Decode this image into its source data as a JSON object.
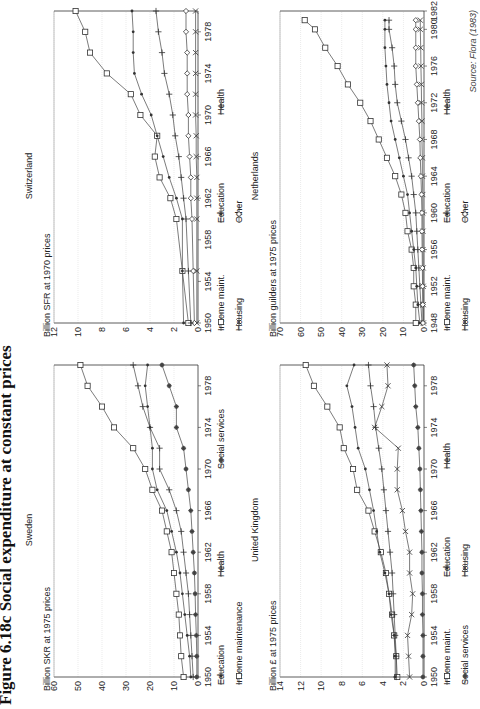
{
  "figure": {
    "title": "Figure 6.18c  Social expenditure at constant prices",
    "source": "Source: Flora (1983)"
  },
  "chart_data": [
    {
      "id": "sweden",
      "type": "line",
      "title": "Sweden",
      "ylabel": "Billion SKR at 1975 prices",
      "xlabel": "",
      "xlim": [
        1950,
        1980
      ],
      "xticks": [
        1950,
        1954,
        1958,
        1962,
        1966,
        1970,
        1974,
        1978
      ],
      "ylim": [
        0,
        60
      ],
      "yticks": [
        0,
        10,
        20,
        30,
        40,
        50,
        60
      ],
      "grid": "horizontal",
      "x": [
        1950,
        1952,
        1954,
        1956,
        1958,
        1960,
        1962,
        1964,
        1966,
        1968,
        1970,
        1972,
        1974,
        1976,
        1978,
        1980
      ],
      "series": [
        {
          "name": "Education",
          "marker": "dot",
          "values": [
            3,
            3.5,
            4.5,
            5.5,
            6.5,
            7.5,
            9,
            11,
            13,
            17,
            19,
            19,
            20,
            21,
            22,
            21
          ]
        },
        {
          "name": "Health",
          "marker": "plus",
          "values": [
            2,
            2.5,
            3,
            3.5,
            4,
            5,
            6,
            7,
            9,
            12,
            16,
            16,
            20,
            23,
            25,
            27
          ]
        },
        {
          "name": "Social services",
          "marker": "star",
          "values": [
            0.5,
            0.5,
            0.7,
            1,
            1.2,
            1.5,
            2,
            2.5,
            3,
            4,
            5,
            6,
            9,
            9,
            12,
            15
          ]
        },
        {
          "name": "Income maintenance",
          "marker": "square",
          "values": [
            6,
            7,
            7.5,
            8,
            9,
            10,
            11,
            13,
            15,
            19,
            22,
            27,
            35,
            40,
            46,
            49
          ]
        }
      ],
      "legend": [
        {
          "name": "Education",
          "marker": "dot"
        },
        {
          "name": "Health",
          "marker": "plus"
        },
        {
          "name": "Social services",
          "marker": "star"
        },
        {
          "name": "Income maintenance",
          "marker": "square"
        }
      ]
    },
    {
      "id": "switzerland",
      "type": "line",
      "title": "Switzerland",
      "ylabel": "Billion SFR at 1970 prices",
      "xlabel": "",
      "xlim": [
        1950,
        1980
      ],
      "xticks": [
        1950,
        1954,
        1958,
        1962,
        1966,
        1970,
        1974,
        1978
      ],
      "ylim": [
        0,
        12
      ],
      "yticks": [
        0,
        2,
        4,
        6,
        8,
        10,
        12
      ],
      "grid": "horizontal",
      "x": [
        1950,
        1955,
        1960,
        1962,
        1964,
        1966,
        1968,
        1970,
        1972,
        1974,
        1976,
        1978,
        1980
      ],
      "series": [
        {
          "name": "Income maint.",
          "marker": "square",
          "values": [
            0.8,
            1.3,
            1.8,
            2.3,
            3.2,
            3.6,
            3.4,
            4.8,
            5.6,
            7.6,
            9.0,
            9.4,
            10.2
          ]
        },
        {
          "name": "Education",
          "marker": "dot",
          "values": [
            1.2,
            1.3,
            1.3,
            1.8,
            2.4,
            2.9,
            3.4,
            3.9,
            4.7,
            5.3,
            5.4,
            5.4,
            5.5
          ]
        },
        {
          "name": "Housing",
          "marker": "x",
          "values": [
            0.1,
            0.1,
            0.1,
            0.1,
            0.1,
            0.15,
            0.15,
            0.2,
            0.2,
            0.2,
            0.2,
            0.2,
            0.2
          ]
        },
        {
          "name": "Other",
          "marker": "diamond",
          "values": [
            0.3,
            0.4,
            0.5,
            0.6,
            0.6,
            0.7,
            0.8,
            0.8,
            0.9,
            0.9,
            0.9,
            1.0,
            1.0
          ]
        },
        {
          "name": "Health",
          "marker": "plus",
          "values": [
            0.6,
            0.8,
            1.0,
            1.2,
            1.4,
            1.6,
            1.9,
            2.1,
            2.4,
            2.8,
            3.0,
            3.3,
            3.5
          ]
        }
      ],
      "legend": [
        {
          "name": "Income maint.",
          "marker": "square"
        },
        {
          "name": "Education",
          "marker": "dot"
        },
        {
          "name": "Health",
          "marker": "plus"
        },
        {
          "name": "Housing",
          "marker": "x"
        },
        {
          "name": "Other",
          "marker": "diamond"
        }
      ]
    },
    {
      "id": "united-kingdom",
      "type": "line",
      "title": "United Kingdom",
      "ylabel": "Billion £ at 1975 prices",
      "xlabel": "",
      "xlim": [
        1950,
        1980
      ],
      "xticks": [
        1950,
        1954,
        1958,
        1962,
        1966,
        1970,
        1974,
        1978
      ],
      "ylim": [
        0,
        14
      ],
      "yticks": [
        0,
        2,
        4,
        6,
        8,
        10,
        12,
        14
      ],
      "grid": "horizontal",
      "x": [
        1950,
        1952,
        1954,
        1956,
        1958,
        1960,
        1962,
        1964,
        1966,
        1968,
        1970,
        1972,
        1974,
        1976,
        1978,
        1980
      ],
      "series": [
        {
          "name": "Income maint.",
          "marker": "square",
          "values": [
            2.6,
            2.7,
            2.9,
            3.1,
            3.4,
            3.7,
            4.2,
            4.8,
            5.4,
            6.5,
            6.9,
            7.8,
            8.2,
            9.4,
            10.7,
            11.5
          ]
        },
        {
          "name": "Education",
          "marker": "dot",
          "values": [
            2.8,
            2.8,
            2.9,
            3.2,
            3.4,
            3.8,
            4.3,
            4.6,
            4.9,
            5.3,
            5.7,
            6.4,
            6.7,
            7.0,
            7.5,
            6.8
          ]
        },
        {
          "name": "Health",
          "marker": "plus",
          "values": [
            2.7,
            2.7,
            2.8,
            2.9,
            3.0,
            3.1,
            3.3,
            3.5,
            3.7,
            3.9,
            4.1,
            4.4,
            4.7,
            4.9,
            5.2,
            5.4
          ]
        },
        {
          "name": "Social services",
          "marker": "star",
          "values": [
            0.1,
            0.1,
            0.1,
            0.15,
            0.15,
            0.2,
            0.2,
            0.25,
            0.3,
            0.35,
            0.4,
            0.5,
            0.6,
            0.8,
            0.9,
            1.0
          ]
        },
        {
          "name": "Housing",
          "marker": "x",
          "values": [
            1.4,
            1.5,
            1.6,
            1.2,
            1.1,
            1.4,
            1.4,
            1.8,
            2.1,
            2.6,
            2.6,
            2.5,
            4.8,
            4.1,
            3.5,
            3.6
          ]
        }
      ],
      "legend": [
        {
          "name": "Income maint.",
          "marker": "square"
        },
        {
          "name": "Education",
          "marker": "dot"
        },
        {
          "name": "Health",
          "marker": "plus"
        },
        {
          "name": "Social services",
          "marker": "star"
        },
        {
          "name": "Housing",
          "marker": "x"
        }
      ]
    },
    {
      "id": "netherlands",
      "type": "line",
      "title": "Netherlands",
      "ylabel": "Billion guilders at 1975 prices",
      "xlabel": "",
      "xlim": [
        1948,
        1982
      ],
      "xticks": [
        1948,
        1952,
        1956,
        1960,
        1964,
        1968,
        1972,
        1976,
        1980,
        1982
      ],
      "ylim": [
        0,
        70
      ],
      "yticks": [
        0,
        10,
        20,
        30,
        40,
        50,
        60,
        70
      ],
      "grid": "horizontal",
      "x": [
        1948,
        1950,
        1952,
        1954,
        1956,
        1958,
        1960,
        1962,
        1964,
        1966,
        1968,
        1970,
        1972,
        1974,
        1976,
        1978,
        1980,
        1981
      ],
      "series": [
        {
          "name": "Income maint.",
          "marker": "square",
          "values": [
            4,
            4,
            5,
            5,
            6,
            8,
            9,
            11,
            14,
            18,
            22,
            26,
            31,
            37,
            42,
            48,
            53,
            58
          ]
        },
        {
          "name": "Education",
          "marker": "dot",
          "values": [
            2,
            3,
            3.5,
            4,
            5,
            6,
            7,
            8,
            10,
            12,
            14,
            16,
            17,
            18,
            18.5,
            19,
            19,
            19
          ]
        },
        {
          "name": "Health",
          "marker": "plus",
          "values": [
            1,
            1.5,
            2,
            2.5,
            3,
            3.5,
            4,
            5,
            6,
            7.5,
            9,
            11,
            13,
            14,
            14.5,
            15.5,
            17,
            17
          ]
        },
        {
          "name": "Housing",
          "marker": "x",
          "values": [
            0.3,
            0.3,
            0.4,
            0.4,
            0.5,
            0.5,
            0.6,
            0.6,
            0.8,
            0.8,
            1,
            1,
            1.2,
            1.3,
            1.5,
            1.6,
            1.8,
            1.8
          ]
        },
        {
          "name": "Other",
          "marker": "diamond",
          "values": [
            0.5,
            0.6,
            0.7,
            0.8,
            0.9,
            1,
            1,
            1.2,
            1.5,
            1.8,
            2,
            2.5,
            3,
            3.5,
            4,
            4,
            4,
            4
          ]
        }
      ],
      "legend": [
        {
          "name": "Income maint.",
          "marker": "square"
        },
        {
          "name": "Education",
          "marker": "dot"
        },
        {
          "name": "Health",
          "marker": "plus"
        },
        {
          "name": "Housing",
          "marker": "x"
        },
        {
          "name": "Other",
          "marker": "diamond"
        }
      ]
    }
  ]
}
